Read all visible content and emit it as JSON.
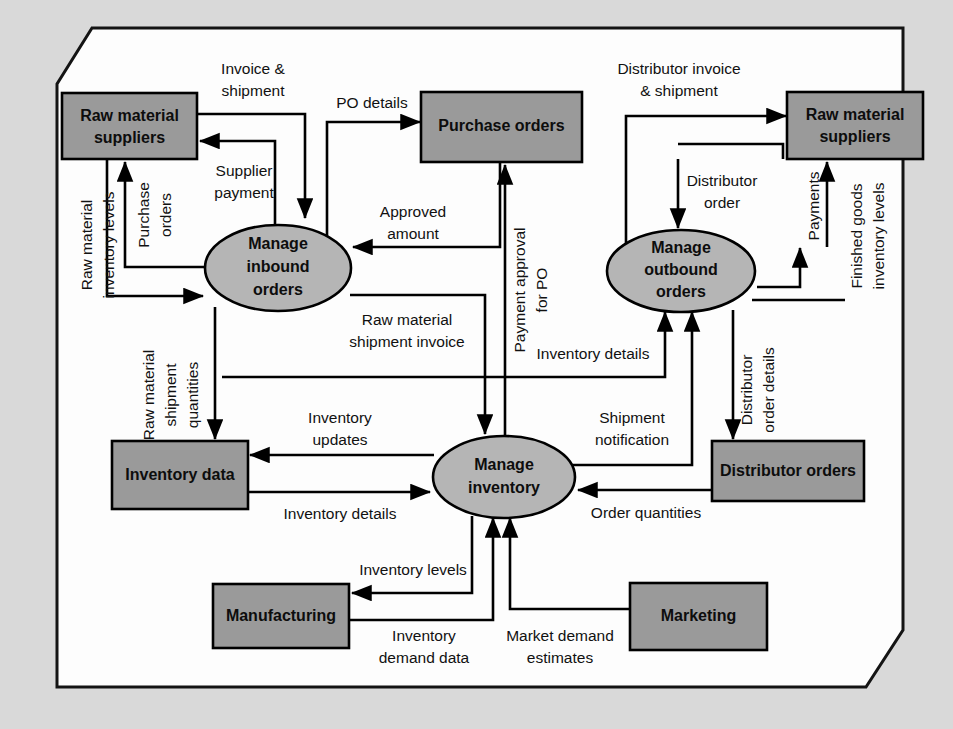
{
  "domain": "diagram",
  "figure": {
    "type": "data-flow-diagram",
    "clipped_title_top": "",
    "frame_shape": "octagonal rounded-cut rectangle",
    "background_color": "#d9d9d9",
    "canvas_color": "#fdfdfd",
    "entity_fill": "#9a9a9a",
    "process_fill": "#b5b5b5",
    "line_color": "#000000"
  },
  "entities": {
    "raw_material_suppliers_left": "Raw material\nsuppliers",
    "raw_material_suppliers_left_l1": "Raw material",
    "raw_material_suppliers_left_l2": "suppliers",
    "purchase_orders": "Purchase orders",
    "raw_material_suppliers_right_l1": "Raw material",
    "raw_material_suppliers_right_l2": "suppliers",
    "inventory_data": "Inventory data",
    "distributor_orders": "Distributor orders",
    "manufacturing": "Manufacturing",
    "marketing": "Marketing"
  },
  "processes": {
    "manage_inbound_l1": "Manage",
    "manage_inbound_l2": "inbound",
    "manage_inbound_l3": "orders",
    "manage_outbound_l1": "Manage",
    "manage_outbound_l2": "outbound",
    "manage_outbound_l3": "orders",
    "manage_inventory_l1": "Manage",
    "manage_inventory_l2": "inventory"
  },
  "flow_labels": {
    "invoice_shipment_l1": "Invoice &",
    "invoice_shipment_l2": "shipment",
    "po_details": "PO details",
    "supplier_payment_l1": "Supplier",
    "supplier_payment_l2": "payment",
    "purchase_orders_l1": "Purchase",
    "purchase_orders_l2": "orders",
    "raw_material_inventory_levels_l1": "Raw material",
    "raw_material_inventory_levels_l2": "inventory levels",
    "approved_amount_l1": "Approved",
    "approved_amount_l2": "amount",
    "raw_material_shipment_quantities_l1": "Raw material",
    "raw_material_shipment_quantities_l2": "shipment",
    "raw_material_shipment_quantities_l3": "quantities",
    "raw_material_shipment_invoice_l1": "Raw material",
    "raw_material_shipment_invoice_l2": "shipment invoice",
    "payment_approval_for_po_l1": "Payment approval",
    "payment_approval_for_po_l2": "for PO",
    "distributor_invoice_shipment_l1": "Distributor invoice",
    "distributor_invoice_shipment_l2": "& shipment",
    "distributor_order_l1": "Distributor",
    "distributor_order_l2": "order",
    "payments": "Payments",
    "finished_goods_inventory_levels_l1": "Finished goods",
    "finished_goods_inventory_levels_l2": "inventory levels",
    "inventory_details_top": "Inventory details",
    "distributor_order_details_l1": "Distributor",
    "distributor_order_details_l2": "order details",
    "inventory_updates_l1": "Inventory",
    "inventory_updates_l2": "updates",
    "shipment_notification_l1": "Shipment",
    "shipment_notification_l2": "notification",
    "inventory_details_left": "Inventory details",
    "order_quantities": "Order quantities",
    "inventory_levels": "Inventory levels",
    "inventory_demand_data_l1": "Inventory",
    "inventory_demand_data_l2": "demand data",
    "market_demand_estimates_l1": "Market demand",
    "market_demand_estimates_l2": "estimates"
  }
}
